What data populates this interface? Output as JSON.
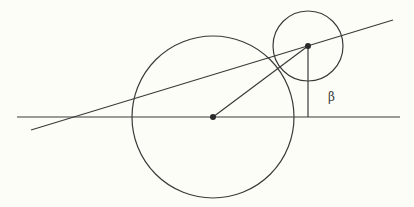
{
  "diagram": {
    "labels": {
      "angle": "β"
    },
    "colors": {
      "stroke": "#3a3a3a",
      "background": "#fdfdf7"
    },
    "shapes": {
      "large_circle": {
        "cx": 213,
        "cy": 117,
        "r": 81
      },
      "small_circle": {
        "cx": 308,
        "cy": 46,
        "r": 35
      },
      "horizontal_line": {
        "x1": 17,
        "y1": 117,
        "x2": 400,
        "y2": 117
      },
      "slanted_line": {
        "x1": 31,
        "y1": 130,
        "x2": 393,
        "y2": 20
      },
      "radius_segment": {
        "x1": 213,
        "y1": 117,
        "x2": 308,
        "y2": 46
      },
      "vertical_segment": {
        "x1": 308,
        "y1": 46,
        "x2": 308,
        "y2": 117
      }
    }
  }
}
